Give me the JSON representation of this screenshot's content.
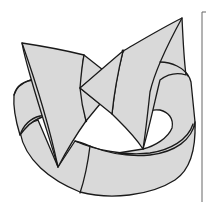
{
  "figure": {
    "colors": {
      "fill": "#d9d9d9",
      "outline": "#1a1a1a",
      "frame": "#666666",
      "background": "#ffffff"
    },
    "elements": [
      {
        "name": "ring-band",
        "label": "Ribbon band"
      },
      {
        "name": "left-arrow-flap",
        "label": "Left arrow flap"
      },
      {
        "name": "right-arrow-flap",
        "label": "Right arrow flap"
      },
      {
        "name": "center-bowtie-fold",
        "label": "Center bow-tie fold"
      }
    ],
    "right_frame_line": {
      "x": 202,
      "y_top": 11,
      "y_bottom": 202
    }
  }
}
